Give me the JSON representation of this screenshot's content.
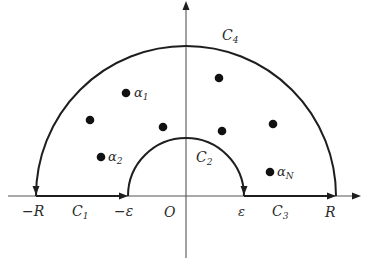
{
  "diagram": {
    "colors": {
      "stroke": "#1e1e1e",
      "text": "#2b2b2b",
      "background": "#ffffff"
    },
    "axes": {
      "origin_label": "O",
      "x_axis_arrow": true,
      "y_axis_arrow": true
    },
    "axis_labels": {
      "neg_R": "−R",
      "neg_eps": "−ε",
      "eps": "ε",
      "R": "R",
      "origin": "O"
    },
    "contours": {
      "C1": {
        "name": "C",
        "sub": "1",
        "description": "segment from −R to −ε"
      },
      "C2": {
        "name": "C",
        "sub": "2",
        "description": "small semicircle radius ε, clockwise from −ε to ε"
      },
      "C3": {
        "name": "C",
        "sub": "3",
        "description": "segment from ε to R"
      },
      "C4": {
        "name": "C",
        "sub": "4",
        "description": "large semicircle radius R, from R to −R"
      }
    },
    "points": [
      {
        "label_name": "α",
        "label_sub": "1",
        "x": 126,
        "y": 93
      },
      {
        "label_name": "",
        "label_sub": "",
        "x": 90,
        "y": 120
      },
      {
        "label_name": "",
        "label_sub": "",
        "x": 163,
        "y": 127
      },
      {
        "label_name": "",
        "label_sub": "",
        "x": 219,
        "y": 78
      },
      {
        "label_name": "",
        "label_sub": "",
        "x": 222,
        "y": 131
      },
      {
        "label_name": "",
        "label_sub": "",
        "x": 273,
        "y": 124
      },
      {
        "label_name": "α",
        "label_sub": "2",
        "x": 101,
        "y": 157
      },
      {
        "label_name": "α",
        "label_sub": "N",
        "x": 270,
        "y": 172
      }
    ]
  }
}
